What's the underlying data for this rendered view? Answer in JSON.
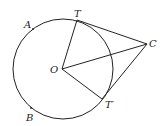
{
  "diagram": {
    "type": "circle-tangent-geometry",
    "labels": {
      "A": "A",
      "T": "T",
      "C": "C",
      "O": "O",
      "T_prime": "T′",
      "B": "B"
    },
    "colors": {
      "stroke": "#222222",
      "background": "#ffffff"
    }
  }
}
